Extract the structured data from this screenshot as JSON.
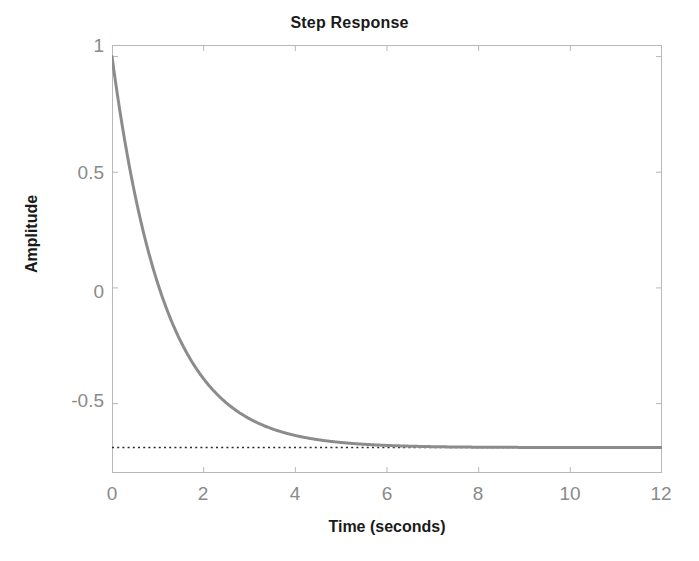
{
  "chart_data": {
    "type": "line",
    "title": "Step Response",
    "xlabel": "Time (seconds)",
    "ylabel": "Amplitude",
    "xlim": [
      0,
      12
    ],
    "ylim": [
      -0.8,
      1.05
    ],
    "xticks": [
      0,
      2,
      4,
      6,
      8,
      10,
      12
    ],
    "xtick_labels": [
      "0",
      "2",
      "4",
      "6",
      "8",
      "10",
      "12"
    ],
    "yticks": [
      1,
      0.5,
      0,
      -0.5
    ],
    "ytick_labels": [
      "1",
      "0.5",
      "0",
      "-0.5"
    ],
    "grid": false,
    "legend": null,
    "box": true,
    "tick_direction": "in",
    "series": [
      {
        "name": "step response",
        "color": "#8c8c8c",
        "linewidth": 3,
        "style": "solid",
        "model": "y(t) = -0.69 + 1.69*exp(-t/1.15)",
        "x": [
          0,
          0.25,
          0.5,
          0.75,
          1,
          1.25,
          1.5,
          1.75,
          2,
          2.5,
          3,
          3.5,
          4,
          4.5,
          5,
          5.5,
          6,
          7,
          8,
          9,
          10,
          11,
          12
        ],
        "y": [
          1.0,
          0.663,
          0.393,
          0.176,
          0.001,
          -0.139,
          -0.252,
          -0.343,
          -0.416,
          -0.522,
          -0.591,
          -0.636,
          -0.664,
          -0.683,
          -0.695,
          -0.702,
          -0.707,
          -0.712,
          -0.714,
          -0.715,
          -0.715,
          -0.715,
          -0.715
        ]
      },
      {
        "name": "steady-state asymptote",
        "color": "#2b2b2b",
        "linewidth": 1.5,
        "style": "dotted",
        "value": -0.69,
        "x": [
          0,
          12
        ],
        "y": [
          -0.69,
          -0.69
        ]
      }
    ],
    "annotations": []
  },
  "axes": {
    "box_color": "#b8b8b8",
    "tick_color": "#b8b8b8",
    "tick_label_color": "#8a8a8a",
    "label_color": "#1a1a1a",
    "background": "#ffffff"
  }
}
